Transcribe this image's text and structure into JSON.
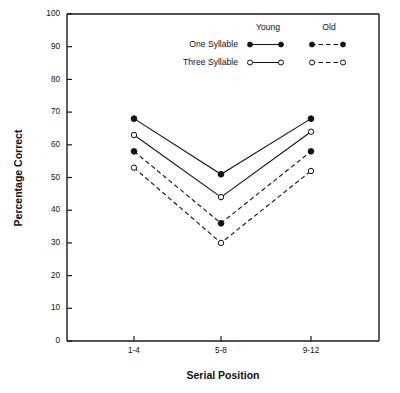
{
  "chart_data": {
    "type": "line",
    "title": "",
    "xlabel": "Serial Position",
    "ylabel": "Percentage Correct",
    "categories": [
      "1-4",
      "5-8",
      "9-12"
    ],
    "ylim": [
      0,
      100
    ],
    "yticks": [
      0,
      10,
      20,
      30,
      40,
      50,
      60,
      70,
      80,
      90,
      100
    ],
    "grid": false,
    "legend_position": "top-right",
    "legend_columns": [
      "Young",
      "Old"
    ],
    "legend_rows": [
      "One Syllable",
      "Three Syllable"
    ],
    "series": [
      {
        "name": "One Syllable Young",
        "group": "Young",
        "syllable": "One Syllable",
        "marker": "filled-circle",
        "line": "solid",
        "values": [
          68,
          51,
          68
        ]
      },
      {
        "name": "Three Syllable Young",
        "group": "Young",
        "syllable": "Three Syllable",
        "marker": "open-circle",
        "line": "solid",
        "values": [
          63,
          44,
          64
        ]
      },
      {
        "name": "One Syllable Old",
        "group": "Old",
        "syllable": "One Syllable",
        "marker": "filled-circle",
        "line": "dashed",
        "values": [
          58,
          36,
          58
        ]
      },
      {
        "name": "Three Syllable Old",
        "group": "Old",
        "syllable": "Three Syllable",
        "marker": "open-circle",
        "line": "dashed",
        "values": [
          53,
          30,
          52
        ]
      }
    ]
  },
  "axes": {
    "y_label": "Percentage Correct",
    "x_label": "Serial Position",
    "y_tick_labels": [
      "0",
      "10",
      "20",
      "30",
      "40",
      "50",
      "60",
      "70",
      "80",
      "90",
      "100"
    ],
    "x_tick_labels": [
      "1-4",
      "5-8",
      "9-12"
    ]
  },
  "legend": {
    "header_young": "Young",
    "header_old": "Old",
    "row_one": "One Syllable",
    "row_three": "Three Syllable"
  },
  "colors": {
    "ink": "#111111",
    "background": "#ffffff"
  }
}
